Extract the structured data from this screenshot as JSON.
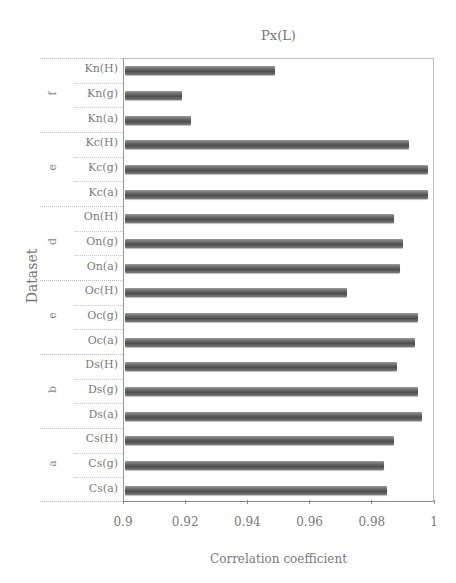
{
  "chart_data": {
    "type": "bar",
    "orientation": "horizontal",
    "title": "Px(L)",
    "xlabel": "Correlation coefficient",
    "ylabel": "Dataset",
    "xlim": [
      0.9,
      1.0
    ],
    "xticks": [
      "0.9",
      "0.92",
      "0.94",
      "0.96",
      "0.98",
      "1"
    ],
    "grid": false,
    "legend": null,
    "groups": [
      {
        "label": "f",
        "items": [
          {
            "category": "Kn(H)",
            "value": 0.949
          },
          {
            "category": "Kn(g)",
            "value": 0.919
          },
          {
            "category": "Kn(a)",
            "value": 0.922
          }
        ]
      },
      {
        "label": "e",
        "items": [
          {
            "category": "Kc(H)",
            "value": 0.992
          },
          {
            "category": "Kc(g)",
            "value": 0.998
          },
          {
            "category": "Kc(a)",
            "value": 0.998
          }
        ]
      },
      {
        "label": "d",
        "items": [
          {
            "category": "On(H)",
            "value": 0.987
          },
          {
            "category": "On(g)",
            "value": 0.99
          },
          {
            "category": "On(a)",
            "value": 0.989
          }
        ]
      },
      {
        "label": "e",
        "items": [
          {
            "category": "Oc(H)",
            "value": 0.972
          },
          {
            "category": "Oc(g)",
            "value": 0.995
          },
          {
            "category": "Oc(a)",
            "value": 0.994
          }
        ]
      },
      {
        "label": "b",
        "items": [
          {
            "category": "Ds(H)",
            "value": 0.988
          },
          {
            "category": "Ds(g)",
            "value": 0.995
          },
          {
            "category": "Ds(a)",
            "value": 0.996
          }
        ]
      },
      {
        "label": "a",
        "items": [
          {
            "category": "Cs(H)",
            "value": 0.987
          },
          {
            "category": "Cs(g)",
            "value": 0.984
          },
          {
            "category": "Cs(a)",
            "value": 0.985
          }
        ]
      }
    ]
  }
}
